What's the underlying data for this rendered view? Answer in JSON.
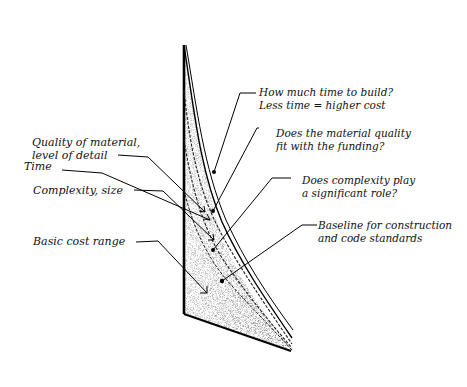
{
  "left_labels": [
    {
      "lines": [
        "Time"
      ]
    },
    {
      "lines": [
        "Quality of material,",
        "level of detail"
      ]
    },
    {
      "lines": [
        "Complexity, size"
      ]
    },
    {
      "lines": [
        "Basic cost range"
      ]
    }
  ],
  "right_labels": [
    {
      "lines": [
        "How much time to build?",
        "Less time = higher cost"
      ]
    },
    {
      "lines": [
        "Does the material quality",
        "fit with the funding?"
      ]
    },
    {
      "lines": [
        "Does complexity play",
        "a significant role?"
      ]
    },
    {
      "lines": [
        "Baseline for construction",
        "and code standards"
      ]
    }
  ]
}
